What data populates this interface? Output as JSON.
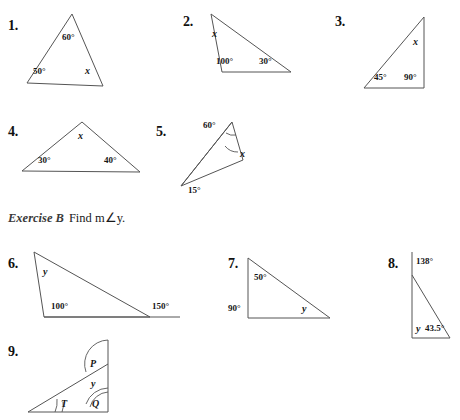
{
  "page": {
    "width": 460,
    "height": 420,
    "background": "#ffffff",
    "ink": "#555555"
  },
  "exercise": {
    "title": "Exercise B",
    "instruction": "Find m∠y."
  },
  "problems": [
    {
      "number": "1.",
      "figure": "triangle",
      "labels": [
        {
          "text": "60°",
          "kind": "angle"
        },
        {
          "text": "50°",
          "kind": "angle"
        },
        {
          "text": "x",
          "kind": "variable"
        }
      ]
    },
    {
      "number": "2.",
      "figure": "triangle",
      "labels": [
        {
          "text": "x",
          "kind": "variable"
        },
        {
          "text": "100°",
          "kind": "angle"
        },
        {
          "text": "30°",
          "kind": "angle"
        }
      ]
    },
    {
      "number": "3.",
      "figure": "right-triangle",
      "labels": [
        {
          "text": "x",
          "kind": "variable"
        },
        {
          "text": "45°",
          "kind": "angle"
        },
        {
          "text": "90°",
          "kind": "angle"
        }
      ]
    },
    {
      "number": "4.",
      "figure": "triangle",
      "labels": [
        {
          "text": "x",
          "kind": "variable"
        },
        {
          "text": "30°",
          "kind": "angle"
        },
        {
          "text": "40°",
          "kind": "angle"
        }
      ]
    },
    {
      "number": "5.",
      "figure": "narrow-triangle-with-cevian",
      "labels": [
        {
          "text": "60°",
          "kind": "angle"
        },
        {
          "text": "x",
          "kind": "variable"
        },
        {
          "text": "15°",
          "kind": "angle"
        }
      ]
    },
    {
      "number": "6.",
      "figure": "triangle-with-extended-base",
      "labels": [
        {
          "text": "y",
          "kind": "variable"
        },
        {
          "text": "100°",
          "kind": "angle"
        },
        {
          "text": "150°",
          "kind": "angle"
        }
      ]
    },
    {
      "number": "7.",
      "figure": "right-triangle",
      "labels": [
        {
          "text": "50°",
          "kind": "angle"
        },
        {
          "text": "90°",
          "kind": "angle"
        },
        {
          "text": "y",
          "kind": "variable"
        }
      ]
    },
    {
      "number": "8.",
      "figure": "right-triangle-with-extended-side",
      "labels": [
        {
          "text": "138°",
          "kind": "angle"
        },
        {
          "text": "y",
          "kind": "variable"
        },
        {
          "text": "43.5°",
          "kind": "angle"
        }
      ]
    },
    {
      "number": "9.",
      "figure": "right-triangle-with-extended-side-arcs",
      "labels": [
        {
          "text": "P",
          "kind": "variable"
        },
        {
          "text": "y",
          "kind": "variable"
        },
        {
          "text": "T",
          "kind": "variable"
        },
        {
          "text": "Q",
          "kind": "variable"
        }
      ]
    }
  ]
}
